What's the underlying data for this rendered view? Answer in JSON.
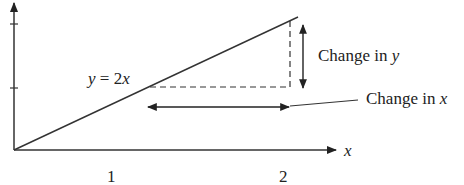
{
  "diagram": {
    "type": "slope-illustration",
    "equation_label": {
      "prefix": "y",
      "eq": " = 2",
      "suffix": "x"
    },
    "change_in_y": {
      "text": "Change in ",
      "var": "y"
    },
    "change_in_x": {
      "text": "Change in ",
      "var": "x"
    },
    "x_axis_label": "x",
    "x_ticks": [
      "1",
      "2"
    ],
    "colors": {
      "stroke": "#333333",
      "text": "#222222",
      "background": "#ffffff"
    }
  }
}
